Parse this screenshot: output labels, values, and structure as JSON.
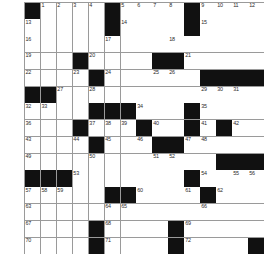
{
  "puzzle": {
    "title": "Crossword Grid",
    "rows": 15,
    "columns": 15,
    "colors": {
      "background": "#ffffff",
      "block": "#111111",
      "gridline": "#9a9a9a",
      "number": "#2a2a2a"
    },
    "grid": [
      [
        "#",
        "1",
        "2",
        "3",
        "4",
        "#",
        "5",
        "6",
        "7",
        "8",
        "#",
        "9",
        "10",
        "11",
        "12"
      ],
      [
        "13",
        "",
        "",
        "",
        "",
        "#",
        "14",
        "",
        "",
        "",
        "#",
        "15",
        "",
        "",
        ""
      ],
      [
        "16",
        "",
        "",
        "",
        "",
        "17",
        "",
        "",
        "",
        "18",
        "",
        "",
        "",
        "",
        ""
      ],
      [
        "19",
        "",
        "",
        "#",
        "20",
        "",
        "",
        "",
        "#",
        "#",
        "21",
        "",
        "",
        "",
        ""
      ],
      [
        "22",
        "",
        "",
        "23",
        "#",
        "24",
        "",
        "",
        "25",
        "26",
        "",
        "#",
        "#",
        "#",
        "#"
      ],
      [
        "#",
        "#",
        "27",
        "",
        "28",
        "",
        "",
        "",
        "",
        "",
        "",
        "29",
        "30",
        "31",
        ""
      ],
      [
        "32",
        "33",
        "",
        "",
        "#",
        "#",
        "#",
        "34",
        "",
        "",
        "#",
        "35",
        "",
        "",
        ""
      ],
      [
        "36",
        "",
        "",
        "#",
        "37",
        "38",
        "39",
        "#",
        "40",
        "",
        "#",
        "41",
        "#",
        "42",
        ""
      ],
      [
        "43",
        "",
        "",
        "44",
        "#",
        "45",
        "",
        "46",
        "#",
        "#",
        "47",
        "48",
        "",
        "",
        ""
      ],
      [
        "49",
        "",
        "",
        "",
        "50",
        "",
        "",
        "",
        "51",
        "52",
        "",
        "",
        "#",
        "#",
        "#"
      ],
      [
        "#",
        "#",
        "#",
        "53",
        "",
        "",
        "",
        "",
        "",
        "",
        "#",
        "54",
        "",
        "55",
        "56"
      ],
      [
        "57",
        "58",
        "59",
        "",
        "",
        "#",
        "#",
        "60",
        "",
        "",
        "61",
        "#",
        "62",
        "",
        ""
      ],
      [
        "63",
        "",
        "",
        "",
        "",
        "64",
        "65",
        "",
        "",
        "",
        "",
        "66",
        "",
        "",
        ""
      ],
      [
        "67",
        "",
        "",
        "",
        "#",
        "68",
        "",
        "",
        "",
        "#",
        "69",
        "",
        "",
        "",
        ""
      ],
      [
        "70",
        "",
        "",
        "",
        "#",
        "71",
        "",
        "",
        "",
        "#",
        "72",
        "",
        "",
        "",
        "#"
      ]
    ],
    "across_numbers": [
      1,
      5,
      9,
      13,
      14,
      15,
      16,
      17,
      18,
      19,
      20,
      21,
      22,
      24,
      27,
      29,
      32,
      34,
      35,
      36,
      37,
      40,
      41,
      42,
      43,
      45,
      47,
      49,
      51,
      53,
      54,
      57,
      60,
      62,
      63,
      64,
      66,
      67,
      68,
      69,
      70,
      71,
      72
    ],
    "down_numbers": [
      1,
      2,
      3,
      4,
      5,
      6,
      7,
      8,
      9,
      10,
      11,
      12,
      17,
      20,
      23,
      25,
      26,
      28,
      30,
      31,
      33,
      38,
      39,
      44,
      46,
      48,
      50,
      52,
      55,
      56,
      58,
      59,
      61,
      65
    ]
  }
}
